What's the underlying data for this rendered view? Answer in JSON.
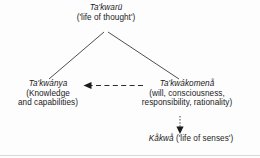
{
  "diagram": {
    "type": "concept-hierarchy",
    "title": "",
    "canvas": {
      "width": 260,
      "height": 158,
      "background": "#fdfdfd"
    },
    "nodes": [
      {
        "id": "takwaru",
        "term": "Ta'kwarü",
        "gloss": "('life of thought')",
        "gloss_inline": false,
        "role": "root"
      },
      {
        "id": "takwanya",
        "term": "Ta'kwánya",
        "gloss_line1": "(Knowledge",
        "gloss_line2": "and capabilities)",
        "role": "branch-left"
      },
      {
        "id": "takwakomena",
        "term": "Ta'kwákomenå",
        "gloss_line1": "(will, consciousness,",
        "gloss_line2": "responsibility, rationality)",
        "role": "branch-right"
      },
      {
        "id": "kakwa",
        "term": "Kåkwå",
        "gloss": "('life of senses')",
        "gloss_inline": true,
        "role": "leaf"
      }
    ],
    "edges": [
      {
        "id": "root-to-left",
        "from": "takwaru",
        "to": "takwanya",
        "style": "solid",
        "arrow": false
      },
      {
        "id": "root-to-right",
        "from": "takwaru",
        "to": "takwakomena",
        "style": "solid",
        "arrow": false
      },
      {
        "id": "komena-to-kwanya",
        "from": "takwakomena",
        "to": "takwanya",
        "style": "dashed",
        "arrow": true,
        "direction": "left"
      },
      {
        "id": "komena-to-kakwa",
        "from": "takwakomena",
        "to": "kakwa",
        "style": "dotted",
        "arrow": true,
        "direction": "down"
      }
    ],
    "colors": {
      "text": "#1b1b1b",
      "solid_edge": "#3a3a3a",
      "dashed_edge": "#2a2a2a",
      "dotted_edge": "#555555",
      "rule": "#d8d8d8"
    }
  }
}
